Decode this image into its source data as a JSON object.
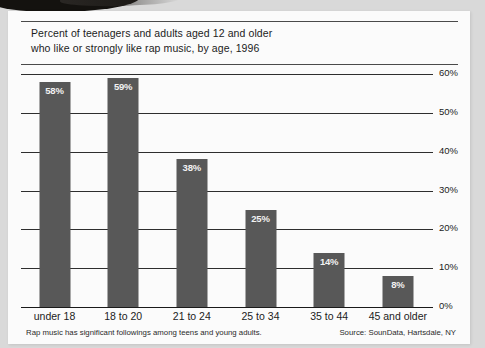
{
  "chart_data": {
    "type": "bar",
    "title": "Percent of teenagers and adults aged 12 and older who like or strongly like rap music, by age, 1996",
    "title_lines": [
      "Percent of teenagers and adults aged 12 and older",
      "who like or strongly like rap music, by age, 1996"
    ],
    "categories": [
      "under 18",
      "18 to 20",
      "21 to 24",
      "25 to 34",
      "35 to 44",
      "45 and older"
    ],
    "values": [
      58,
      59,
      38,
      25,
      14,
      8
    ],
    "value_labels": [
      "58%",
      "59%",
      "38%",
      "25%",
      "14%",
      "8%"
    ],
    "xlabel": "",
    "ylabel": "",
    "ylim": [
      0,
      60
    ],
    "ytick_values": [
      0,
      10,
      20,
      30,
      40,
      50,
      60
    ],
    "ytick_labels": [
      "0%",
      "10%",
      "20%",
      "30%",
      "40%",
      "50%",
      "60%"
    ],
    "grid": true,
    "legend": "none",
    "bar_color": "#585858",
    "value_label_color": "#f2f2f2",
    "axis_color": "#2e2e2e"
  },
  "footer": {
    "note": "Rap music has significant followings among teens and young adults.",
    "source": "Source: SounData, Hartsdale, NY"
  }
}
